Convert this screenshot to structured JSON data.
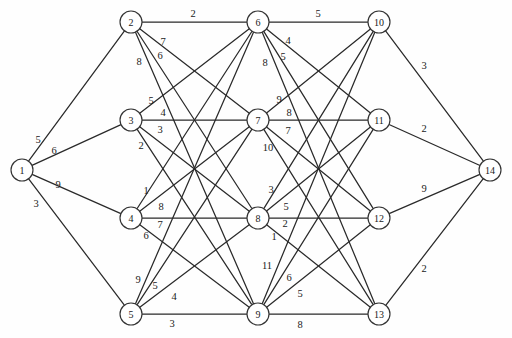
{
  "chart_data": {
    "type": "diagram",
    "diagram_kind": "weighted-undirected-graph",
    "title": "",
    "xlabel": "",
    "ylabel": "",
    "node_shape": "circle",
    "node_radius": 11,
    "edge_style": "straight-line",
    "layout": "layered-bipartite-columns",
    "columns": [
      {
        "name": "source",
        "nodes": [
          "1"
        ]
      },
      {
        "name": "layer-1",
        "nodes": [
          "2",
          "3",
          "4",
          "5"
        ]
      },
      {
        "name": "layer-2",
        "nodes": [
          "6",
          "7",
          "8",
          "9"
        ]
      },
      {
        "name": "layer-3",
        "nodes": [
          "10",
          "11",
          "12",
          "13"
        ]
      },
      {
        "name": "sink",
        "nodes": [
          "14"
        ]
      }
    ],
    "nodes": [
      {
        "id": "1",
        "label": "1",
        "x": 22,
        "y": 170
      },
      {
        "id": "2",
        "label": "2",
        "x": 131,
        "y": 22
      },
      {
        "id": "3",
        "label": "3",
        "x": 131,
        "y": 120
      },
      {
        "id": "4",
        "label": "4",
        "x": 131,
        "y": 218
      },
      {
        "id": "5",
        "label": "5",
        "x": 131,
        "y": 314
      },
      {
        "id": "6",
        "label": "6",
        "x": 258,
        "y": 22
      },
      {
        "id": "7",
        "label": "7",
        "x": 258,
        "y": 120
      },
      {
        "id": "8",
        "label": "8",
        "x": 258,
        "y": 218
      },
      {
        "id": "9",
        "label": "9",
        "x": 258,
        "y": 314
      },
      {
        "id": "10",
        "label": "10",
        "x": 379,
        "y": 22
      },
      {
        "id": "11",
        "label": "11",
        "x": 379,
        "y": 120
      },
      {
        "id": "12",
        "label": "12",
        "x": 379,
        "y": 218
      },
      {
        "id": "13",
        "label": "13",
        "x": 379,
        "y": 314
      },
      {
        "id": "14",
        "label": "14",
        "x": 490,
        "y": 170
      }
    ],
    "edges": [
      {
        "from": "1",
        "to": "2",
        "weight": "5",
        "lx": 38,
        "ly": 139
      },
      {
        "from": "1",
        "to": "3",
        "weight": "6",
        "lx": 54,
        "ly": 150
      },
      {
        "from": "1",
        "to": "4",
        "weight": "9",
        "lx": 58,
        "ly": 184
      },
      {
        "from": "1",
        "to": "5",
        "weight": "3",
        "lx": 36,
        "ly": 203
      },
      {
        "from": "2",
        "to": "6",
        "weight": "2",
        "lx": 193,
        "ly": 13
      },
      {
        "from": "2",
        "to": "7",
        "weight": "7",
        "lx": 163,
        "ly": 41
      },
      {
        "from": "2",
        "to": "8",
        "weight": "6",
        "lx": 160,
        "ly": 55
      },
      {
        "from": "2",
        "to": "9",
        "weight": "8",
        "lx": 139,
        "ly": 61
      },
      {
        "from": "3",
        "to": "6",
        "weight": "5",
        "lx": 151,
        "ly": 100
      },
      {
        "from": "3",
        "to": "7",
        "weight": "4",
        "lx": 163,
        "ly": 112
      },
      {
        "from": "3",
        "to": "8",
        "weight": "3",
        "lx": 160,
        "ly": 129
      },
      {
        "from": "3",
        "to": "9",
        "weight": "2",
        "lx": 141,
        "ly": 145
      },
      {
        "from": "4",
        "to": "6",
        "weight": "1",
        "lx": 146,
        "ly": 190
      },
      {
        "from": "4",
        "to": "7",
        "weight": "8",
        "lx": 161,
        "ly": 206
      },
      {
        "from": "4",
        "to": "8",
        "weight": "7",
        "lx": 160,
        "ly": 224
      },
      {
        "from": "4",
        "to": "9",
        "weight": "6",
        "lx": 146,
        "ly": 235
      },
      {
        "from": "5",
        "to": "6",
        "weight": "9",
        "lx": 138,
        "ly": 279
      },
      {
        "from": "5",
        "to": "7",
        "weight": "5",
        "lx": 155,
        "ly": 285
      },
      {
        "from": "5",
        "to": "8",
        "weight": "4",
        "lx": 174,
        "ly": 296
      },
      {
        "from": "5",
        "to": "9",
        "weight": "3",
        "lx": 172,
        "ly": 323
      },
      {
        "from": "6",
        "to": "10",
        "weight": "5",
        "lx": 318,
        "ly": 13
      },
      {
        "from": "6",
        "to": "11",
        "weight": "4",
        "lx": 288,
        "ly": 40
      },
      {
        "from": "6",
        "to": "12",
        "weight": "5",
        "lx": 283,
        "ly": 56
      },
      {
        "from": "6",
        "to": "13",
        "weight": "8",
        "lx": 265,
        "ly": 62
      },
      {
        "from": "7",
        "to": "10",
        "weight": "9",
        "lx": 279,
        "ly": 99
      },
      {
        "from": "7",
        "to": "11",
        "weight": "8",
        "lx": 289,
        "ly": 112
      },
      {
        "from": "7",
        "to": "12",
        "weight": "7",
        "lx": 288,
        "ly": 130
      },
      {
        "from": "7",
        "to": "13",
        "weight": "10",
        "lx": 268,
        "ly": 147
      },
      {
        "from": "8",
        "to": "10",
        "weight": "3",
        "lx": 271,
        "ly": 189
      },
      {
        "from": "8",
        "to": "11",
        "weight": "5",
        "lx": 286,
        "ly": 206
      },
      {
        "from": "8",
        "to": "12",
        "weight": "2",
        "lx": 285,
        "ly": 223
      },
      {
        "from": "8",
        "to": "13",
        "weight": "1",
        "lx": 274,
        "ly": 236
      },
      {
        "from": "9",
        "to": "10",
        "weight": "11",
        "lx": 267,
        "ly": 265
      },
      {
        "from": "9",
        "to": "11",
        "weight": "6",
        "lx": 289,
        "ly": 277
      },
      {
        "from": "9",
        "to": "12",
        "weight": "5",
        "lx": 300,
        "ly": 293
      },
      {
        "from": "9",
        "to": "13",
        "weight": "8",
        "lx": 300,
        "ly": 324
      },
      {
        "from": "10",
        "to": "14",
        "weight": "3",
        "lx": 424,
        "ly": 65
      },
      {
        "from": "11",
        "to": "14",
        "weight": "2",
        "lx": 424,
        "ly": 128
      },
      {
        "from": "12",
        "to": "14",
        "weight": "9",
        "lx": 424,
        "ly": 188
      },
      {
        "from": "13",
        "to": "14",
        "weight": "2",
        "lx": 424,
        "ly": 268
      }
    ],
    "colors": {
      "background": "#fefefe",
      "edge": "#2a2a2a",
      "node_fill": "#ffffff",
      "node_stroke": "#333333",
      "text": "#1a1a1a"
    }
  }
}
